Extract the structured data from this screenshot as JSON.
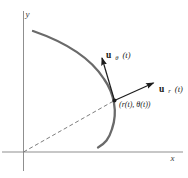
{
  "figure": {
    "background_color": "#ffffff",
    "axis_color": "#8f8f8f",
    "curve_color": "#6a6a6a",
    "dashed_color": "#6e6e6e",
    "arrow_color": "#1c1c1c",
    "text_color": "#1a1a1a",
    "labels": {
      "y_axis": "y",
      "x_axis": "x",
      "point": "(r(t), θ(t))",
      "u_theta": {
        "vec": "u",
        "sub": "θ",
        "arg": "(t)"
      },
      "u_r": {
        "vec": "u",
        "sub": "r",
        "arg": "(t)"
      }
    }
  }
}
